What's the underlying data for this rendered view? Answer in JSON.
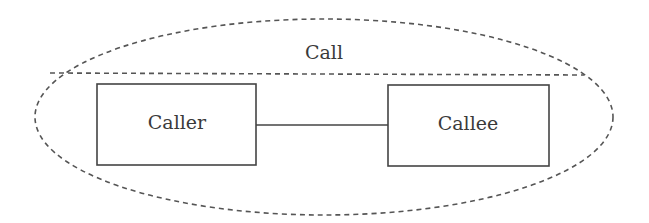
{
  "diagram": {
    "container": {
      "label": "Call",
      "style": "dashed-ellipse",
      "color": "#555555"
    },
    "nodes": [
      {
        "id": "caller",
        "label": "Caller"
      },
      {
        "id": "callee",
        "label": "Callee"
      }
    ],
    "edges": [
      {
        "from": "caller",
        "to": "callee",
        "style": "solid"
      }
    ],
    "colors": {
      "stroke": "#444444",
      "dash": "#555555",
      "text": "#3a3a3a",
      "background": "#ffffff"
    }
  }
}
